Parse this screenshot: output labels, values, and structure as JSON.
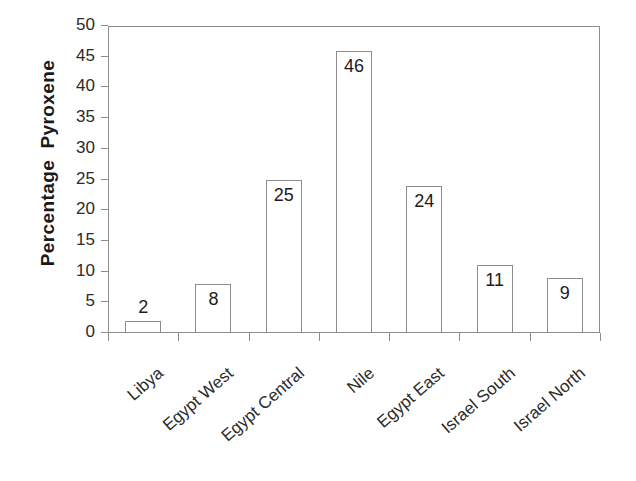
{
  "chart_data": {
    "type": "bar",
    "title": "",
    "xlabel": "",
    "ylabel": "Percentage  Pyroxene",
    "categories": [
      "Libya",
      "Egypt West",
      "Egypt Central",
      "Nile",
      "Egypt East",
      "Israel South",
      "Israel North"
    ],
    "values": [
      2,
      8,
      25,
      46,
      24,
      11,
      9
    ],
    "value_labels": [
      "2",
      "8",
      "25",
      "46",
      "24",
      "11",
      "9"
    ],
    "ylim": [
      0,
      50
    ],
    "ytick_step": 5,
    "ytick_labels": [
      "0",
      "5",
      "10",
      "15",
      "20",
      "25",
      "30",
      "35",
      "40",
      "45",
      "50"
    ],
    "grid": false,
    "legend": false,
    "legend_position": "none",
    "bar_fill_color": "#ffffff",
    "bar_edge_color": "#8d8d8d",
    "axis_color": "#8d8d8d",
    "text_color": "#2b2b2b",
    "background_color": "#ffffff",
    "xtick_label_rotation": -41
  }
}
